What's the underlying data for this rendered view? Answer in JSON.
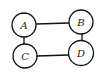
{
  "diagram": {
    "type": "undirected-graph",
    "nodes": [
      {
        "id": "A",
        "label": "A",
        "cx": 24,
        "cy": 25,
        "r": 12
      },
      {
        "id": "B",
        "label": "B",
        "cx": 81,
        "cy": 22,
        "r": 12
      },
      {
        "id": "C",
        "label": "C",
        "cx": 25,
        "cy": 56,
        "r": 12
      },
      {
        "id": "D",
        "label": "D",
        "cx": 81,
        "cy": 53,
        "r": 12.5
      }
    ],
    "edges": [
      {
        "from": "A",
        "to": "B"
      },
      {
        "from": "A",
        "to": "C"
      },
      {
        "from": "C",
        "to": "D"
      },
      {
        "from": "B",
        "to": "D"
      }
    ]
  }
}
